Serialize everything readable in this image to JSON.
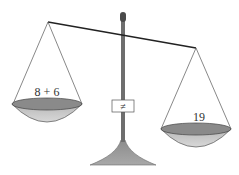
{
  "diagram": {
    "type": "balance-scale",
    "left_pan": {
      "label": "8 + 6"
    },
    "right_pan": {
      "label": "19"
    },
    "relation_sign": "≠",
    "colors": {
      "line": "#2a2a2a",
      "post": "#6e6e6e",
      "pan_rim": "#8a8a8a",
      "pan_bowl": "#c4c4c4",
      "base": "#9a9a9a"
    }
  }
}
